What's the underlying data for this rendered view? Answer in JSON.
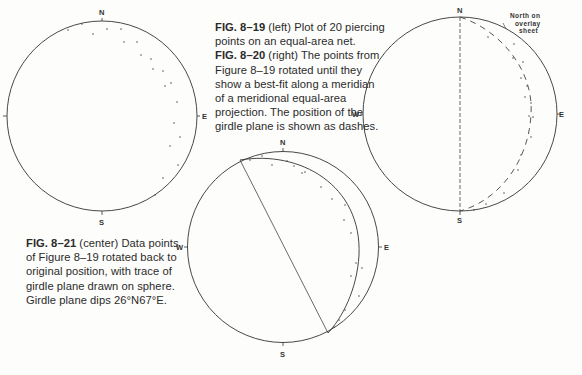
{
  "captions": {
    "fig_8_19": {
      "label": "FIG. 8–19",
      "text": " (left)   Plot of 20 piercing points on an equal-area net."
    },
    "fig_8_20": {
      "label": "FIG. 8–20",
      "text": " (right)   The points from Figure 8–19 rotated until they show a best-fit along a meridian of a meridional equal-area projection. The position of the girdle plane is shown as dashes."
    },
    "fig_8_21": {
      "label": "FIG. 8–21",
      "text": " (center)   Data points of Figure 8–19 rotated back to original position, with trace of girdle plane drawn on sphere. Girdle plane dips 26°N67°E."
    }
  },
  "directions": {
    "north": "N",
    "south": "S",
    "east": "E",
    "west": "W"
  },
  "overlay_note": [
    "North  on",
    "overlay",
    "sheet"
  ],
  "chart_data": [
    {
      "type": "scatter",
      "title": "FIG. 8–19 Plot of 20 piercing points on an equal-area net",
      "projection": "equal-area net (circle)",
      "labels": [
        "N",
        "S",
        "E"
      ],
      "point_count": 20,
      "points_px": [
        [
          68,
          30
        ],
        [
          82,
          24
        ],
        [
          93,
          34
        ],
        [
          107,
          29
        ],
        [
          121,
          29
        ],
        [
          124,
          42
        ],
        [
          137,
          42
        ],
        [
          141,
          55
        ],
        [
          151,
          59
        ],
        [
          153,
          69
        ],
        [
          163,
          71
        ],
        [
          165,
          86
        ],
        [
          171,
          83
        ],
        [
          177,
          102
        ],
        [
          174,
          123
        ],
        [
          180,
          137
        ],
        [
          170,
          146
        ],
        [
          178,
          165
        ],
        [
          163,
          178
        ],
        [
          155,
          195
        ]
      ]
    },
    {
      "type": "scatter",
      "title": "FIG. 8–20 Points rotated to best-fit meridian; girdle plane as dashes",
      "labels": [
        "N",
        "S",
        "E",
        "W"
      ],
      "annotation": "North on overlay sheet",
      "girdle": "dashed great-circle arc from N to S bulging east",
      "points_px": [
        [
          488,
          37
        ],
        [
          514,
          44
        ],
        [
          513,
          58
        ],
        [
          523,
          62
        ],
        [
          521,
          78
        ],
        [
          527,
          86
        ],
        [
          525,
          97
        ],
        [
          531,
          103
        ],
        [
          529,
          116
        ],
        [
          533,
          117
        ],
        [
          531,
          137
        ],
        [
          521,
          155
        ],
        [
          518,
          170
        ],
        [
          504,
          193
        ],
        [
          486,
          204
        ],
        [
          474,
          210
        ]
      ]
    },
    {
      "type": "scatter",
      "title": "FIG. 8–21 Data points rotated back to original position with girdle plane trace",
      "labels": [
        "N",
        "S",
        "E",
        "W"
      ],
      "girdle_plane_dip": "26°N67°E",
      "points_px": [
        [
          262,
          156
        ],
        [
          250,
          160
        ],
        [
          272,
          165
        ],
        [
          287,
          161
        ],
        [
          294,
          166
        ],
        [
          302,
          173
        ],
        [
          305,
          172
        ],
        [
          321,
          187
        ],
        [
          332,
          199
        ],
        [
          345,
          205
        ],
        [
          344,
          220
        ],
        [
          351,
          233
        ],
        [
          356,
          263
        ],
        [
          362,
          268
        ],
        [
          351,
          276
        ],
        [
          359,
          296
        ],
        [
          345,
          310
        ],
        [
          339,
          320
        ],
        [
          334,
          327
        ]
      ]
    }
  ]
}
